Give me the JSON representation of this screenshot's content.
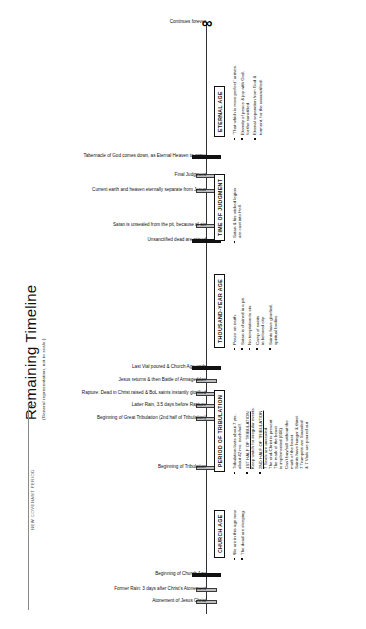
{
  "title": {
    "main": "Remaining Timeline",
    "sub": "(General representation, not to scale.)"
  },
  "axis": {
    "top_label": "Continues forever",
    "infinity_symbol": "∞"
  },
  "covenant": {
    "label": "NEW COVENANT PERIOD"
  },
  "events": [
    {
      "label": "Tabernacle of God comes down, as Eternal Heaven to come",
      "style": "dark",
      "width": "wide",
      "y": 155
    },
    {
      "label": "Final Judgment",
      "style": "gray",
      "width": "narrow",
      "y": 174
    },
    {
      "label": "Current earth and heaven eternally separate from Jesus",
      "style": "gray",
      "width": "narrow",
      "y": 189
    },
    {
      "label": "Satan is unsealed from the pit, because of sin",
      "style": "gray",
      "width": "narrow",
      "y": 224
    },
    {
      "label": "Unsanctified dead are raised",
      "style": "dark",
      "width": "wide",
      "y": 239
    },
    {
      "label": "Last Vial poured & Church Age ends",
      "style": "dark",
      "width": "wide",
      "y": 366
    },
    {
      "label": "Jesus returns & then Battle of Armageddon",
      "style": "gray",
      "width": "narrow",
      "y": 379
    },
    {
      "label": "Rapture: Dead in Christ raised & BoL saints instantly glorified",
      "style": "gray",
      "width": "narrow",
      "y": 392
    },
    {
      "label": "Latter Rain, 3.5 days before Rapture",
      "style": "gray",
      "width": "narrow",
      "y": 404
    },
    {
      "label": "Beginning of Great Tribulation (2nd half of Tribulation)",
      "style": "gray",
      "width": "narrow",
      "y": 417
    },
    {
      "label": "Beginning of Tribulation",
      "style": "gray",
      "width": "narrow",
      "y": 466
    },
    {
      "label": "Beginning of Church Age",
      "style": "dark",
      "width": "wide",
      "y": 573
    },
    {
      "label": "Former Rain: 3 days after Christ's Atonement",
      "style": "gray",
      "width": "narrow",
      "y": 588
    },
    {
      "label": "Atonement of Jesus Christ",
      "style": "gray",
      "width": "narrow",
      "y": 600
    }
  ],
  "eras": [
    {
      "name": "ETERNAL AGE",
      "box": {
        "left": 214,
        "top": 137
      },
      "bullets_pos": {
        "left": 232,
        "top": 140
      },
      "bullets": [
        {
          "lines": [
            "\"That which is more perfect\" arrives."
          ]
        },
        {
          "lines": [
            "Eternity of peace & joy with God,",
            "for the sanctified."
          ]
        },
        {
          "lines": [
            "Eternal separation from God &",
            "torment, for the unsanctified."
          ]
        }
      ]
    },
    {
      "name": "TIME OF JUDGMENT",
      "box": {
        "left": 214,
        "top": 241
      },
      "bullets_pos": {
        "left": 232,
        "top": 243
      },
      "bullets": [
        {
          "lines": [
            "Satan & his wicked legion",
            "are cast into Hell."
          ]
        }
      ]
    },
    {
      "name": "THOUSAND-YEAR AGE",
      "box": {
        "left": 214,
        "top": 348
      },
      "bullets_pos": {
        "left": 232,
        "top": 350
      },
      "bullets": [
        {
          "lines": [
            "Peace on earth."
          ]
        },
        {
          "lines": [
            "Satan is chained in a pit."
          ]
        },
        {
          "lines": [
            "No temptation to sin."
          ]
        },
        {
          "lines": [
            "Camp of saints",
            "in beloved city."
          ]
        },
        {
          "lines": [
            "Saints have glorified,",
            "spiritual bodies."
          ]
        }
      ]
    },
    {
      "name": "PERIOD OF TRIBULATION",
      "box": {
        "left": 214,
        "top": 472
      },
      "bullets_pos": {
        "left": 232,
        "top": 474
      },
      "bullets": [
        {
          "lines": [
            "Tribulation lasts about 7 yrs,",
            "about 42 mo. each half."
          ]
        },
        {
          "heading": "1ST HALF OF TRIBULATION",
          "lines": [
            "Keep watch for irregular events."
          ]
        },
        {
          "heading": "2ND HALF OF TRIBULATION",
          "lines": [
            "7 Seals are unsealed.",
            "The end-Christ is present.",
            "The mark of the beast",
            "is implemented (666).",
            "Can't buy/sell without the",
            "mark of the beast.",
            "Saints have hunger & thirst.",
            "7 Trumpets are Sounded",
            "& 7 Vials are poured out."
          ]
        }
      ]
    },
    {
      "name": "CHURCH AGE",
      "box": {
        "left": 214,
        "top": 558
      },
      "bullets_pos": {
        "left": 232,
        "top": 560
      },
      "bullets": [
        {
          "lines": [
            "We are in this age now."
          ]
        },
        {
          "lines": [
            "The dead are sleeping."
          ]
        }
      ]
    }
  ]
}
